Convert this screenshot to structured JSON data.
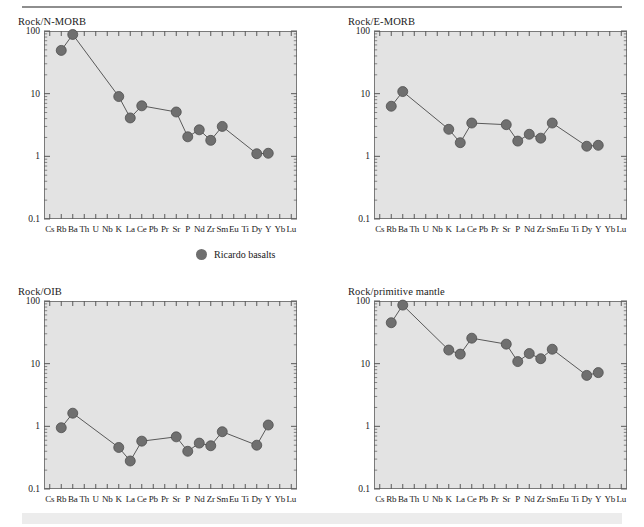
{
  "figure": {
    "legend": {
      "marker_label": "Ricardo basalts",
      "marker_color": "#6f6f6f"
    },
    "elements": [
      "Cs",
      "Rb",
      "Ba",
      "Th",
      "U",
      "Nb",
      "K",
      "La",
      "Ce",
      "Pb",
      "Pr",
      "Sr",
      "P",
      "Nd",
      "Zr",
      "Sm",
      "Eu",
      "Ti",
      "Dy",
      "Y",
      "Yb",
      "Lu"
    ],
    "y_ticks": [
      "100",
      "10",
      "1",
      "0.1"
    ],
    "panel_bg": "#e3e3e3",
    "axis_color": "#7a7a7a"
  },
  "chart_data": [
    {
      "type": "line",
      "title": "Rock/N-MORB",
      "xlabel": "",
      "ylabel": "",
      "yscale": "log",
      "ylim": [
        0.1,
        100
      ],
      "grid": false,
      "legend_position": "below-figure",
      "categories": [
        "Cs",
        "Rb",
        "Ba",
        "Th",
        "U",
        "Nb",
        "K",
        "La",
        "Ce",
        "Pb",
        "Pr",
        "Sr",
        "P",
        "Nd",
        "Zr",
        "Sm",
        "Eu",
        "Ti",
        "Dy",
        "Y",
        "Yb",
        "Lu"
      ],
      "series": [
        {
          "name": "Ricardo basalts",
          "points": [
            {
              "x": "Rb",
              "y": 49
            },
            {
              "x": "Ba",
              "y": 88
            },
            {
              "x": "K",
              "y": 9.0
            },
            {
              "x": "La",
              "y": 4.1
            },
            {
              "x": "Ce",
              "y": 6.4
            },
            {
              "x": "Sr",
              "y": 5.1
            },
            {
              "x": "P",
              "y": 2.05
            },
            {
              "x": "Nd",
              "y": 2.65
            },
            {
              "x": "Zr",
              "y": 1.8
            },
            {
              "x": "Sm",
              "y": 3.0
            },
            {
              "x": "Dy",
              "y": 1.1
            },
            {
              "x": "Y",
              "y": 1.12
            }
          ]
        }
      ]
    },
    {
      "type": "line",
      "title": "Rock/E-MORB",
      "xlabel": "",
      "ylabel": "",
      "yscale": "log",
      "ylim": [
        0.1,
        100
      ],
      "grid": false,
      "legend_position": "below-figure",
      "categories": [
        "Cs",
        "Rb",
        "Ba",
        "Th",
        "U",
        "Nb",
        "K",
        "La",
        "Ce",
        "Pb",
        "Pr",
        "Sr",
        "P",
        "Nd",
        "Zr",
        "Sm",
        "Eu",
        "Ti",
        "Dy",
        "Y",
        "Yb",
        "Lu"
      ],
      "series": [
        {
          "name": "Ricardo basalts",
          "points": [
            {
              "x": "Rb",
              "y": 6.3
            },
            {
              "x": "Ba",
              "y": 10.8
            },
            {
              "x": "K",
              "y": 2.7
            },
            {
              "x": "La",
              "y": 1.65
            },
            {
              "x": "Ce",
              "y": 3.4
            },
            {
              "x": "Sr",
              "y": 3.2
            },
            {
              "x": "P",
              "y": 1.75
            },
            {
              "x": "Nd",
              "y": 2.25
            },
            {
              "x": "Zr",
              "y": 1.95
            },
            {
              "x": "Sm",
              "y": 3.4
            },
            {
              "x": "Dy",
              "y": 1.45
            },
            {
              "x": "Y",
              "y": 1.5
            }
          ]
        }
      ]
    },
    {
      "type": "line",
      "title": "Rock/OIB",
      "xlabel": "",
      "ylabel": "",
      "yscale": "log",
      "ylim": [
        0.1,
        100
      ],
      "grid": false,
      "legend_position": "below-figure",
      "categories": [
        "Cs",
        "Rb",
        "Ba",
        "Th",
        "U",
        "Nb",
        "K",
        "La",
        "Ce",
        "Pb",
        "Pr",
        "Sr",
        "P",
        "Nd",
        "Zr",
        "Sm",
        "Eu",
        "Ti",
        "Dy",
        "Y",
        "Yb",
        "Lu"
      ],
      "series": [
        {
          "name": "Ricardo basalts",
          "points": [
            {
              "x": "Rb",
              "y": 0.95
            },
            {
              "x": "Ba",
              "y": 1.62
            },
            {
              "x": "K",
              "y": 0.46
            },
            {
              "x": "La",
              "y": 0.28
            },
            {
              "x": "Ce",
              "y": 0.58
            },
            {
              "x": "Sr",
              "y": 0.68
            },
            {
              "x": "P",
              "y": 0.4
            },
            {
              "x": "Nd",
              "y": 0.54
            },
            {
              "x": "Zr",
              "y": 0.49
            },
            {
              "x": "Sm",
              "y": 0.82
            },
            {
              "x": "Dy",
              "y": 0.5
            },
            {
              "x": "Y",
              "y": 1.05
            }
          ]
        }
      ]
    },
    {
      "type": "line",
      "title": "Rock/primitive mantle",
      "xlabel": "",
      "ylabel": "",
      "yscale": "log",
      "ylim": [
        0.1,
        100
      ],
      "grid": false,
      "legend_position": "below-figure",
      "categories": [
        "Cs",
        "Rb",
        "Ba",
        "Th",
        "U",
        "Nb",
        "K",
        "La",
        "Ce",
        "Pb",
        "Pr",
        "Sr",
        "P",
        "Nd",
        "Zr",
        "Sm",
        "Eu",
        "Ti",
        "Dy",
        "Y",
        "Yb",
        "Lu"
      ],
      "series": [
        {
          "name": "Ricardo basalts",
          "points": [
            {
              "x": "Rb",
              "y": 45
            },
            {
              "x": "Ba",
              "y": 86
            },
            {
              "x": "K",
              "y": 16.5
            },
            {
              "x": "La",
              "y": 14.2
            },
            {
              "x": "Ce",
              "y": 25.5
            },
            {
              "x": "Sr",
              "y": 20.5
            },
            {
              "x": "P",
              "y": 10.8
            },
            {
              "x": "Nd",
              "y": 14.5
            },
            {
              "x": "Zr",
              "y": 12.0
            },
            {
              "x": "Sm",
              "y": 17.0
            },
            {
              "x": "Dy",
              "y": 6.5
            },
            {
              "x": "Y",
              "y": 7.2
            }
          ]
        }
      ]
    }
  ]
}
